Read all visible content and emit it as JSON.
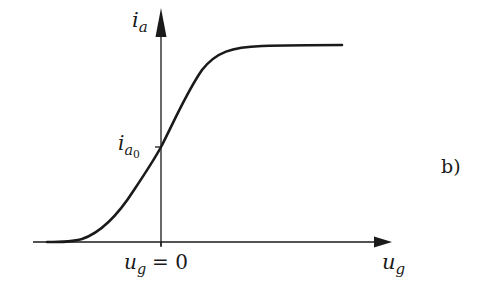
{
  "figure": {
    "panel_label": "b)",
    "y_axis": {
      "symbol": "i",
      "subscript": "a"
    },
    "x_axis": {
      "symbol": "u",
      "subscript": "g"
    },
    "y_tick": {
      "symbol": "i",
      "subscript": "a",
      "subsubscript": "0"
    },
    "x_tick": {
      "symbol": "u",
      "subscript": "g",
      "relation": "= 0"
    },
    "curve": "sigmoid characteristic i_a vs u_g",
    "colors": {
      "ink": "#1a1a1a",
      "background": "#ffffff"
    }
  }
}
